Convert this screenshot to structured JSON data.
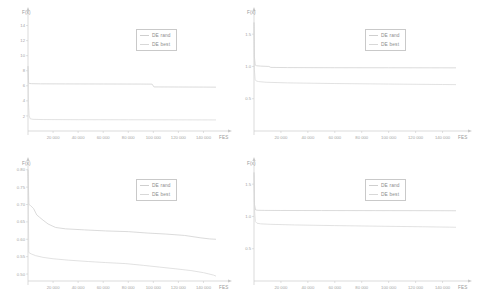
{
  "figure": {
    "panel_count": 4,
    "legend_labels": [
      "DE rand",
      "DE best"
    ],
    "series_colors": {
      "de_rand": "#cfcfcf",
      "de_best": "#d8d8d8"
    },
    "axis_color": "#c8c8c8"
  },
  "chart_data": [
    {
      "id": "panel-top-left",
      "type": "line",
      "title": "",
      "xlabel": "FES",
      "ylabel": "F(x)",
      "xlim": [
        0,
        150000
      ],
      "ylim": [
        0,
        15
      ],
      "grid": false,
      "legend_position": "upper-right",
      "xticks": [
        20000,
        40000,
        60000,
        80000,
        100000,
        120000,
        140000
      ],
      "xticklabels": [
        "20 000",
        "40 000",
        "60 000",
        "80 000",
        "100 000",
        "120 000",
        "140 000"
      ],
      "yticks": [
        2,
        4,
        6,
        8,
        10,
        12,
        14
      ],
      "yticklabels": [
        "2",
        "4",
        "6",
        "8",
        "10",
        "12",
        "14"
      ],
      "series": [
        {
          "name": "DE rand",
          "x": [
            0,
            500,
            1500,
            3000,
            10000,
            30000,
            60000,
            90000,
            99000,
            100500,
            120000,
            140000,
            150000
          ],
          "values": [
            8.6,
            6.35,
            6.3,
            6.28,
            6.26,
            6.25,
            6.24,
            6.23,
            6.22,
            5.85,
            5.84,
            5.83,
            5.82
          ]
        },
        {
          "name": "DE best",
          "x": [
            0,
            400,
            900,
            1800,
            4000,
            12000,
            40000,
            80000,
            120000,
            150000
          ],
          "values": [
            8.6,
            3.6,
            2.0,
            1.62,
            1.55,
            1.52,
            1.5,
            1.49,
            1.48,
            1.47
          ]
        }
      ]
    },
    {
      "id": "panel-top-right",
      "type": "line",
      "title": "",
      "xlabel": "FES",
      "ylabel": "F(x)",
      "xlim": [
        0,
        150000
      ],
      "ylim": [
        0,
        1.75
      ],
      "grid": false,
      "legend_position": "upper-right",
      "xticks": [
        20000,
        40000,
        60000,
        80000,
        100000,
        120000,
        140000
      ],
      "xticklabels": [
        "20 000",
        "40 000",
        "60 000",
        "80 000",
        "100 000",
        "120 000",
        "140 000"
      ],
      "yticks": [
        0.5,
        1.0,
        1.5
      ],
      "yticklabels": [
        "0.5",
        "1.0",
        "1.5"
      ],
      "series": [
        {
          "name": "DE rand",
          "x": [
            0,
            300,
            900,
            2000,
            5000,
            11000,
            12500,
            25000,
            60000,
            100000,
            150000
          ],
          "values": [
            1.68,
            1.15,
            1.02,
            1.01,
            1.005,
            1.0,
            0.985,
            0.982,
            0.98,
            0.979,
            0.978
          ]
        },
        {
          "name": "DE best",
          "x": [
            0,
            300,
            800,
            1600,
            3500,
            9000,
            25000,
            60000,
            100000,
            140000,
            150000
          ],
          "values": [
            1.68,
            0.95,
            0.8,
            0.775,
            0.765,
            0.755,
            0.745,
            0.735,
            0.727,
            0.72,
            0.718
          ]
        }
      ]
    },
    {
      "id": "panel-bottom-left",
      "type": "line",
      "title": "",
      "xlabel": "FES",
      "ylabel": "F(x)",
      "xlim": [
        0,
        150000
      ],
      "ylim": [
        0.48,
        0.805
      ],
      "grid": false,
      "legend_position": "upper-right",
      "xticks": [
        20000,
        40000,
        60000,
        80000,
        100000,
        120000,
        140000
      ],
      "xticklabels": [
        "20 000",
        "40 000",
        "60 000",
        "80 000",
        "100 000",
        "120 000",
        "140 000"
      ],
      "yticks": [
        0.5,
        0.55,
        0.6,
        0.65,
        0.7,
        0.75,
        0.8
      ],
      "yticklabels": [
        "0.50",
        "0.55",
        "0.60",
        "0.65",
        "0.70",
        "0.75",
        "0.80"
      ],
      "series": [
        {
          "name": "DE rand",
          "x": [
            0,
            700,
            2000,
            4500,
            7000,
            9000,
            12000,
            16000,
            22000,
            30000,
            45000,
            62000,
            80000,
            95000,
            110000,
            125000,
            138000,
            145000,
            150000
          ],
          "values": [
            0.8,
            0.7,
            0.697,
            0.688,
            0.67,
            0.664,
            0.655,
            0.644,
            0.634,
            0.63,
            0.627,
            0.624,
            0.622,
            0.618,
            0.615,
            0.611,
            0.604,
            0.601,
            0.6
          ]
        },
        {
          "name": "DE best",
          "x": [
            0,
            600,
            2500,
            6000,
            12000,
            20000,
            32000,
            48000,
            62000,
            78000,
            92000,
            105000,
            118000,
            130000,
            140000,
            148000,
            150000
          ],
          "values": [
            0.8,
            0.562,
            0.558,
            0.553,
            0.548,
            0.544,
            0.54,
            0.536,
            0.533,
            0.53,
            0.525,
            0.52,
            0.515,
            0.51,
            0.504,
            0.497,
            0.494
          ]
        }
      ]
    },
    {
      "id": "panel-bottom-right",
      "type": "line",
      "title": "",
      "xlabel": "FES",
      "ylabel": "F(x)",
      "xlim": [
        0,
        150000
      ],
      "ylim": [
        0,
        1.75
      ],
      "grid": false,
      "legend_position": "upper-right",
      "xticks": [
        20000,
        40000,
        60000,
        80000,
        100000,
        120000,
        140000
      ],
      "xticklabels": [
        "20 000",
        "40 000",
        "60 000",
        "80 000",
        "100 000",
        "120 000",
        "140 000"
      ],
      "yticks": [
        0.5,
        1.0,
        1.5
      ],
      "yticklabels": [
        "0.5",
        "1.0",
        "1.5"
      ],
      "series": [
        {
          "name": "DE rand",
          "x": [
            0,
            400,
            1200,
            3000,
            8000,
            20000,
            50000,
            90000,
            130000,
            150000
          ],
          "values": [
            1.68,
            1.18,
            1.1,
            1.095,
            1.093,
            1.092,
            1.091,
            1.09,
            1.089,
            1.088
          ]
        },
        {
          "name": "DE best",
          "x": [
            0,
            400,
            1000,
            2200,
            5000,
            12000,
            30000,
            60000,
            95000,
            125000,
            145000,
            150000
          ],
          "values": [
            1.68,
            1.1,
            0.92,
            0.895,
            0.885,
            0.878,
            0.868,
            0.858,
            0.848,
            0.84,
            0.834,
            0.832
          ]
        }
      ]
    }
  ]
}
